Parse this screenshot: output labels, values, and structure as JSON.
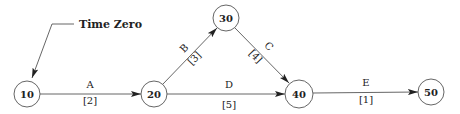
{
  "diagram": {
    "type": "activity-on-arrow network",
    "callout": {
      "label": "Time Zero",
      "points_to": "10"
    },
    "nodes": [
      {
        "id": "10",
        "label": "10",
        "cx": 27,
        "cy": 94,
        "r": 13
      },
      {
        "id": "20",
        "label": "20",
        "cx": 154,
        "cy": 94,
        "r": 13
      },
      {
        "id": "30",
        "label": "30",
        "cx": 226,
        "cy": 18,
        "r": 13
      },
      {
        "id": "40",
        "label": "40",
        "cx": 299,
        "cy": 94,
        "r": 14
      },
      {
        "id": "50",
        "label": "50",
        "cx": 431,
        "cy": 92,
        "r": 13
      }
    ],
    "edges": [
      {
        "activity": "A",
        "duration": "[2]",
        "from": "10",
        "to": "20"
      },
      {
        "activity": "B",
        "duration": "[3]",
        "from": "20",
        "to": "30"
      },
      {
        "activity": "C",
        "duration": "[4]",
        "from": "30",
        "to": "40"
      },
      {
        "activity": "D",
        "duration": "[5]",
        "from": "20",
        "to": "40"
      },
      {
        "activity": "E",
        "duration": "[1]",
        "from": "40",
        "to": "50"
      }
    ]
  }
}
